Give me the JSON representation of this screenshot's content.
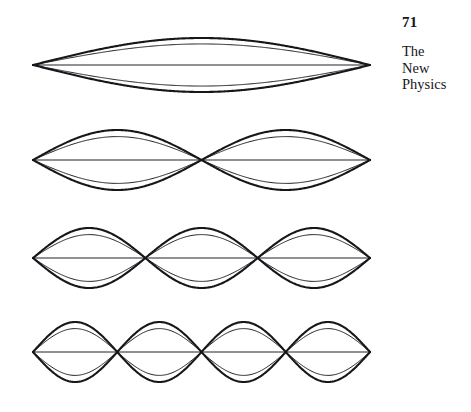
{
  "page": {
    "background_color": "#ffffff",
    "ink_color": "#17161a",
    "width": 471,
    "height": 412
  },
  "header": {
    "page_number": "71",
    "book_title_lines": [
      "The",
      "New",
      "Physics"
    ]
  },
  "figure": {
    "stroke_color": "#17161a",
    "outer_stroke_width": 2.1,
    "inner_stroke_width": 0.95,
    "axis_stroke_width": 0.95,
    "x_start": 33,
    "x_end": 370,
    "inner_amplitude_ratio": 0.78,
    "modes": [
      {
        "name": "fundamental",
        "harmonic": 1,
        "loops": 1,
        "centerline_y": 65,
        "amplitude": 27,
        "label": "Mode 1"
      },
      {
        "name": "second-harmonic",
        "harmonic": 2,
        "loops": 2,
        "centerline_y": 160,
        "amplitude": 30,
        "label": "Mode 2"
      },
      {
        "name": "third-harmonic",
        "harmonic": 3,
        "loops": 3,
        "centerline_y": 258,
        "amplitude": 30,
        "label": "Mode 3"
      },
      {
        "name": "fourth-harmonic",
        "harmonic": 4,
        "loops": 4,
        "centerline_y": 352,
        "amplitude": 30,
        "label": "Mode 4"
      }
    ]
  },
  "chart_data": {
    "type": "line",
    "xlabel": "",
    "ylabel": "",
    "x": [
      0,
      1
    ],
    "series": [
      {
        "name": "Mode 1 outer envelope (upper)",
        "harmonic": 1,
        "amplitude": 27,
        "antinodes": 1
      },
      {
        "name": "Mode 1 outer envelope (lower)",
        "harmonic": 1,
        "amplitude": -27,
        "antinodes": 1
      },
      {
        "name": "Mode 1 inner curve (upper)",
        "harmonic": 1,
        "amplitude": 21,
        "antinodes": 1
      },
      {
        "name": "Mode 1 inner curve (lower)",
        "harmonic": 1,
        "amplitude": -21,
        "antinodes": 1
      },
      {
        "name": "Mode 1 equilibrium axis",
        "harmonic": 1,
        "amplitude": 0,
        "antinodes": 0
      },
      {
        "name": "Mode 2 outer envelope (upper)",
        "harmonic": 2,
        "amplitude": 30,
        "antinodes": 2
      },
      {
        "name": "Mode 2 outer envelope (lower)",
        "harmonic": 2,
        "amplitude": -30,
        "antinodes": 2
      },
      {
        "name": "Mode 2 inner curve (upper)",
        "harmonic": 2,
        "amplitude": 23,
        "antinodes": 2
      },
      {
        "name": "Mode 2 inner curve (lower)",
        "harmonic": 2,
        "amplitude": -23,
        "antinodes": 2
      },
      {
        "name": "Mode 2 equilibrium axis",
        "harmonic": 2,
        "amplitude": 0,
        "antinodes": 0
      },
      {
        "name": "Mode 3 outer envelope (upper)",
        "harmonic": 3,
        "amplitude": 30,
        "antinodes": 3
      },
      {
        "name": "Mode 3 outer envelope (lower)",
        "harmonic": 3,
        "amplitude": -30,
        "antinodes": 3
      },
      {
        "name": "Mode 3 inner curve (upper)",
        "harmonic": 3,
        "amplitude": 23,
        "antinodes": 3
      },
      {
        "name": "Mode 3 inner curve (lower)",
        "harmonic": 3,
        "amplitude": -23,
        "antinodes": 3
      },
      {
        "name": "Mode 3 equilibrium axis",
        "harmonic": 3,
        "amplitude": 0,
        "antinodes": 0
      },
      {
        "name": "Mode 4 outer envelope (upper)",
        "harmonic": 4,
        "amplitude": 30,
        "antinodes": 4
      },
      {
        "name": "Mode 4 outer envelope (lower)",
        "harmonic": 4,
        "amplitude": -30,
        "antinodes": 4
      },
      {
        "name": "Mode 4 inner curve (upper)",
        "harmonic": 4,
        "amplitude": 23,
        "antinodes": 4
      },
      {
        "name": "Mode 4 inner curve (lower)",
        "harmonic": 4,
        "amplitude": -23,
        "antinodes": 4
      },
      {
        "name": "Mode 4 equilibrium axis",
        "harmonic": 4,
        "amplitude": 0,
        "antinodes": 0
      }
    ],
    "grid": false,
    "legend": "none"
  }
}
